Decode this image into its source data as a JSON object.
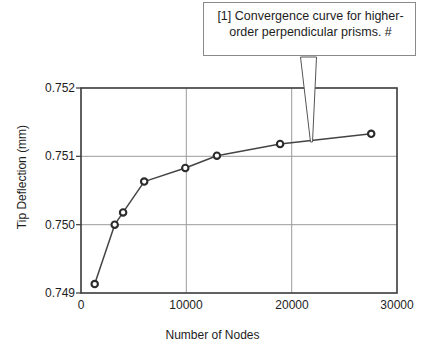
{
  "chart_data": {
    "type": "line",
    "title": "",
    "xlabel": "Number of Nodes",
    "ylabel": "Tip Deflection (mm)",
    "xlim": [
      0,
      30000
    ],
    "ylim": [
      0.749,
      0.752
    ],
    "xticks": [
      "0",
      "10000",
      "20000",
      "30000"
    ],
    "xtick_values": [
      0,
      10000,
      20000,
      30000
    ],
    "yticks": [
      "0.749",
      "0.750",
      "0.751",
      "0.752"
    ],
    "ytick_values": [
      0.749,
      0.75,
      0.751,
      0.752
    ],
    "grid": true,
    "legend": null,
    "marker": "circle-open",
    "line_color": "#444444",
    "marker_color": "#333333",
    "x": [
      1300,
      3200,
      4000,
      6000,
      9900,
      12900,
      18900,
      27550
    ],
    "values": [
      0.74913,
      0.75,
      0.75018,
      0.75063,
      0.75083,
      0.75101,
      0.75118,
      0.75133
    ],
    "series": [
      {
        "name": "Convergence",
        "points": [
          {
            "x": 1300,
            "y": 0.74913
          },
          {
            "x": 3200,
            "y": 0.75
          },
          {
            "x": 4000,
            "y": 0.75018
          },
          {
            "x": 6000,
            "y": 0.75063
          },
          {
            "x": 9900,
            "y": 0.75083
          },
          {
            "x": 12900,
            "y": 0.75101
          },
          {
            "x": 18900,
            "y": 0.75118
          },
          {
            "x": 27550,
            "y": 0.75133
          }
        ]
      }
    ],
    "annotations": [
      {
        "text": "[1] Convergence curve for higher-order perpendicular prisms. #",
        "target_x": 22000,
        "target_y": 0.75123
      }
    ]
  },
  "callout": {
    "text": "[1] Convergence curve for higher-order perpendicular prisms. #"
  },
  "axes": {
    "x_title": "Number of Nodes",
    "y_title": "Tip Deflection (mm)",
    "x_tick_0": "0",
    "x_tick_1": "10000",
    "x_tick_2": "20000",
    "x_tick_3": "30000",
    "y_tick_0": "0.749",
    "y_tick_1": "0.750",
    "y_tick_2": "0.751",
    "y_tick_3": "0.752"
  },
  "colors": {
    "plot_frame": "#3a3a3a",
    "grid": "#9a9a9a",
    "series": "#444444",
    "callout_border": "#8a8a8a",
    "text": "#1d1d1d",
    "background": "#ffffff"
  }
}
